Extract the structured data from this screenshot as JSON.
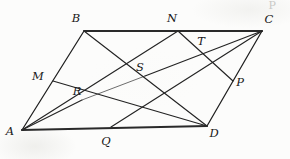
{
  "figure": {
    "background_color": "#fcfcfb",
    "ink_color": "#1f1f1f",
    "canvas": {
      "width": 290,
      "height": 159
    },
    "vertices": [
      {
        "id": "A",
        "label": "A",
        "x": 22,
        "y": 130,
        "label_x": 10,
        "label_y": 132,
        "role": "parallelogram-vertex"
      },
      {
        "id": "B",
        "label": "B",
        "x": 84,
        "y": 31,
        "label_x": 76,
        "label_y": 19,
        "role": "parallelogram-vertex"
      },
      {
        "id": "C",
        "label": "C",
        "x": 262,
        "y": 31,
        "label_x": 269,
        "label_y": 20,
        "role": "parallelogram-vertex"
      },
      {
        "id": "D",
        "label": "D",
        "x": 207,
        "y": 126,
        "label_x": 214,
        "label_y": 134,
        "role": "parallelogram-vertex"
      }
    ],
    "side_points": [
      {
        "id": "M",
        "label": "M",
        "x": 53,
        "y": 81,
        "label_x": 38,
        "label_y": 77,
        "on_side": "AB"
      },
      {
        "id": "N",
        "label": "N",
        "x": 178,
        "y": 31,
        "label_x": 172,
        "label_y": 19,
        "on_side": "BC"
      },
      {
        "id": "P",
        "label": "P",
        "x": 233,
        "y": 81,
        "label_x": 240,
        "label_y": 83,
        "on_side": "CD"
      },
      {
        "id": "Q",
        "label": "Q",
        "x": 111,
        "y": 127,
        "label_x": 106,
        "label_y": 142,
        "on_side": "AD"
      }
    ],
    "intersection_points": [
      {
        "id": "R",
        "label": "R",
        "x": 82,
        "y": 100,
        "label_x": 77,
        "label_y": 92,
        "role": "intersection"
      },
      {
        "id": "S",
        "label": "S",
        "x": 145,
        "y": 76,
        "label_x": 140,
        "label_y": 68,
        "role": "intersection"
      },
      {
        "id": "T",
        "label": "T",
        "x": 207,
        "y": 50,
        "label_x": 201,
        "label_y": 42,
        "role": "intersection"
      }
    ],
    "sides": [
      {
        "id": "AB",
        "from": "A",
        "to": "B",
        "weight": "normal"
      },
      {
        "id": "BC",
        "from": "B",
        "to": "C",
        "weight": "heavy"
      },
      {
        "id": "CD",
        "from": "C",
        "to": "D",
        "weight": "normal"
      },
      {
        "id": "DA",
        "from": "D",
        "to": "A",
        "weight": "heavy"
      }
    ],
    "cevians": [
      {
        "id": "A-to-C",
        "from": "A",
        "to": "C",
        "style": "faded",
        "note": "diagonal through R and S"
      },
      {
        "id": "B-to-D",
        "from": "B",
        "to": "D",
        "style": "solid",
        "note": "diagonal through S"
      },
      {
        "id": "M-to-D",
        "from": "M",
        "to": "D",
        "style": "solid",
        "note": "through R"
      },
      {
        "id": "A-to-N",
        "from": "A",
        "to": "N",
        "style": "solid",
        "note": "through R and S"
      },
      {
        "id": "N-to-P",
        "from": "N",
        "to": "P",
        "style": "solid",
        "note": "through T"
      },
      {
        "id": "C-to-Q",
        "from": "C",
        "to": "Q",
        "style": "solid",
        "note": "through T and S"
      }
    ],
    "artifact": {
      "glyph": "P",
      "description": "faint scan artifact at top-right"
    }
  }
}
